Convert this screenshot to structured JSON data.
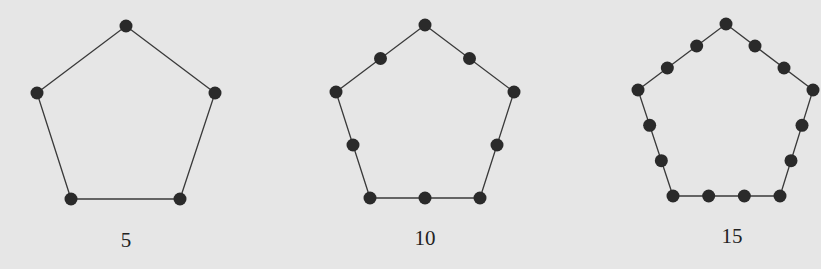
{
  "figure": {
    "pentagons": [
      {
        "label": "5",
        "points_per_side": 2,
        "vertices": [
          [
            126,
            26
          ],
          [
            215,
            93
          ],
          [
            180,
            199
          ],
          [
            71,
            199
          ],
          [
            37,
            93
          ]
        ],
        "label_pos": [
          126,
          247
        ]
      },
      {
        "label": "10",
        "points_per_side": 3,
        "vertices": [
          [
            425,
            25
          ],
          [
            514,
            92
          ],
          [
            480,
            198
          ],
          [
            370,
            198
          ],
          [
            336,
            92
          ]
        ],
        "label_pos": [
          425,
          245
        ]
      },
      {
        "label": "15",
        "points_per_side": 4,
        "vertices": [
          [
            726,
            24
          ],
          [
            813,
            90
          ],
          [
            780,
            196
          ],
          [
            673,
            196
          ],
          [
            638,
            90
          ]
        ],
        "label_pos": [
          732,
          243
        ]
      }
    ]
  },
  "colors": {
    "background": "#e6e6e6",
    "edge": "#3a3a3a",
    "dot": "#2a2a2a"
  }
}
